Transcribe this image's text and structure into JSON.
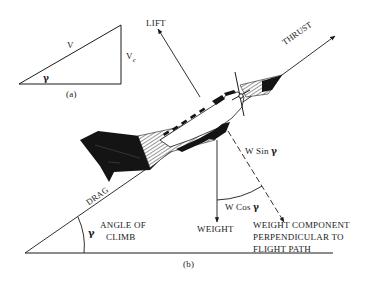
{
  "diagram": {
    "part_a": {
      "caption": "(a)",
      "hypotenuse_label": "V",
      "vertical_label": "V",
      "vertical_label_sub": "c",
      "angle_symbol": "γ"
    },
    "part_b": {
      "caption": "(b)",
      "forces": {
        "lift": "LIFT",
        "thrust": "THRUST",
        "drag": "DRAG",
        "weight": "WEIGHT"
      },
      "components": {
        "w_sin": "W Sin",
        "w_cos": "W Cos",
        "gamma": "γ"
      },
      "angle_of_climb": {
        "symbol": "γ",
        "line1": "ANGLE OF",
        "line2": "CLIMB"
      },
      "perpendicular_label": {
        "line1": "WEIGHT COMPONENT",
        "line2": "PERPENDICULAR TO",
        "line3": "FLIGHT PATH"
      }
    },
    "colors": {
      "ink": "#1a1a1a",
      "background": "#ffffff"
    }
  }
}
